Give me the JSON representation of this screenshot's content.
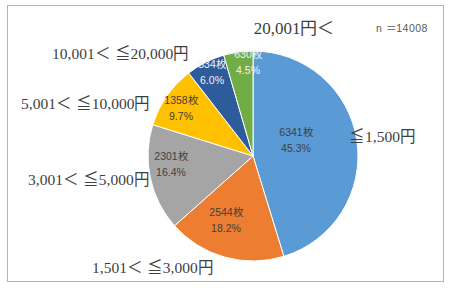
{
  "chart": {
    "title": "20,001円＜",
    "sample_note": "n ＝14008",
    "frame_border_color": "#b5b5b5",
    "background": "#ffffff"
  },
  "chart_data": {
    "type": "pie",
    "title": "20,001円＜",
    "annotation": "n ＝14008",
    "total": 14008,
    "unit_suffix": "枚",
    "start_angle_deg": 0,
    "direction": "clockwise",
    "legend_position": "outside-labels",
    "categories": [
      "≦1,500円",
      "1,501＜ ≦3,000円",
      "3,001＜ ≦5,000円",
      "5,001＜ ≦10,000円",
      "10,001＜ ≦20,000円",
      "20,001円＜"
    ],
    "values": [
      6341,
      2544,
      2301,
      1358,
      834,
      630
    ],
    "percents": [
      45.3,
      18.2,
      16.4,
      9.7,
      6.0,
      4.5
    ],
    "value_labels": [
      "6341枚",
      "2544枚",
      "2301枚",
      "1358枚",
      "834枚",
      "630枚"
    ],
    "percent_labels": [
      "45.3%",
      "18.2%",
      "16.4%",
      "9.7%",
      "6.0%",
      "4.5%"
    ],
    "colors": [
      "#5b9bd5",
      "#ed7d31",
      "#a5a5a5",
      "#ffc000",
      "#2e5b99",
      "#70ad47"
    ],
    "series": [
      {
        "name": "枚数",
        "values": [
          6341,
          2544,
          2301,
          1358,
          834,
          630
        ]
      }
    ]
  },
  "labels": {
    "cat0": "≦1,500円",
    "cat1": "1,501＜ ≦3,000円",
    "cat2": "3,001＜ ≦5,000円",
    "cat3": "5,001＜ ≦10,000円",
    "cat4": "10,001＜ ≦20,000円",
    "cat5": "20,001円＜"
  },
  "slices": {
    "s0": {
      "value": "6341枚",
      "percent": "45.3%"
    },
    "s1": {
      "value": "2544枚",
      "percent": "18.2%"
    },
    "s2": {
      "value": "2301枚",
      "percent": "16.4%"
    },
    "s3": {
      "value": "1358枚",
      "percent": "9.7%"
    },
    "s4": {
      "value": "834枚",
      "percent": "6.0%"
    },
    "s5": {
      "value": "630枚",
      "percent": "4.5%"
    }
  }
}
